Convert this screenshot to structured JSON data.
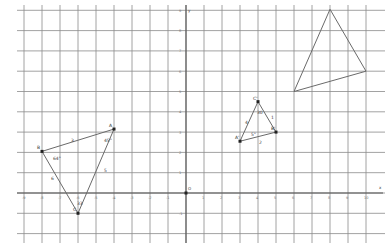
{
  "diagram": {
    "type": "coordinate-grid",
    "origin_label": "O",
    "x_axis_label": "x",
    "y_axis_label": "y",
    "x_ticks": [
      "-9",
      "-8",
      "-7",
      "-6",
      "-5",
      "-4",
      "-3",
      "-2",
      "-1",
      "0",
      "1",
      "2",
      "3",
      "4",
      "5",
      "6",
      "7",
      "8",
      "9",
      "10"
    ],
    "y_ticks": [
      "-1",
      "1",
      "2",
      "3",
      "4",
      "5",
      "6",
      "7",
      "8",
      "9"
    ],
    "colors": {
      "grid": "#8a8a8a",
      "axis": "#555555",
      "shape": "#6a6a6a",
      "point": "#222222"
    }
  },
  "triangles": [
    {
      "name": "ABC",
      "vertices": [
        {
          "label": "A",
          "x": -4,
          "y": 3.15
        },
        {
          "label": "B",
          "x": -8,
          "y": 2.05
        },
        {
          "label": "C",
          "x": -6,
          "y": -1
        }
      ],
      "side_labels": {
        "AB": "3",
        "AC": "5",
        "BC": "6"
      },
      "angles": {
        "A": "45°",
        "B": "64°",
        "C": "33"
      }
    },
    {
      "name": "A'B'C'",
      "vertices": [
        {
          "label": "A'",
          "x": 3,
          "y": 2.55
        },
        {
          "label": "B'",
          "x": 5,
          "y": 3
        },
        {
          "label": "C'",
          "x": 4,
          "y": 4.5
        }
      ],
      "side_labels": {
        "A'C'": "4",
        "B'C'": "1",
        "A'B'": "2"
      },
      "angles": {
        "A'": "5°",
        "B'": "",
        "C'": "30"
      }
    },
    {
      "name": "large",
      "vertices": [
        {
          "label": "",
          "x": 6,
          "y": 5
        },
        {
          "label": "",
          "x": 8,
          "y": 9.05
        },
        {
          "label": "",
          "x": 10,
          "y": 6
        }
      ]
    }
  ]
}
